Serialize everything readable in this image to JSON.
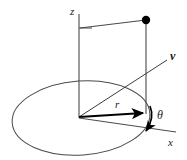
{
  "figure": {
    "kind": "coordinate-system-diagram",
    "background_color": "#ffffff",
    "stroke_color": "#3c3c3c",
    "bold_stroke_color": "#000000",
    "labels": {
      "z_axis": "z",
      "x_axis": "x",
      "vector": "v",
      "radius": "r",
      "angle": "θ"
    },
    "geometry": {
      "origin": {
        "x": 79,
        "y": 117
      },
      "z_axis_top": {
        "x": 79,
        "y": 14
      },
      "point": {
        "x": 146,
        "y": 20
      },
      "point_radius": 4.2,
      "plane_foot": {
        "x": 146,
        "y": 113
      },
      "z_tick_left": {
        "x": 79,
        "y": 28
      },
      "vector_tip": {
        "x": 169,
        "y": 58
      },
      "x_axis_end": {
        "x": 176,
        "y": 132
      },
      "ellipse": {
        "cx": 81,
        "cy": 118,
        "rx": 69,
        "ry": 37,
        "rotation": -4
      }
    },
    "label_positions": {
      "z": {
        "x": 70,
        "y": 15
      },
      "x": {
        "x": 168,
        "y": 145
      },
      "v": {
        "x": 170,
        "y": 59
      },
      "r": {
        "x": 115,
        "y": 107
      },
      "theta": {
        "x": 154,
        "y": 117
      }
    }
  }
}
